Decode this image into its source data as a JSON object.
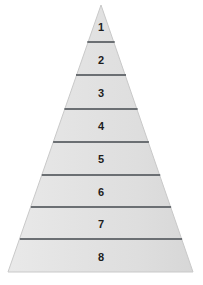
{
  "figure": {
    "name": "numbered-pyramid",
    "title": "",
    "shape": "triangle",
    "tier_count": 8,
    "background_color": "#ffffff",
    "fill_color": "#e3e3e3",
    "fill_color_light": "#ededed",
    "fill_color_dark": "#d8d8d8",
    "outline_color": "#c9c9c9",
    "divider_color": "#6b6f73",
    "label_color": "#1d1d1d",
    "apex": {
      "x": 101,
      "y": 5
    },
    "base_left": {
      "x": 8,
      "y": 272
    },
    "base_right": {
      "x": 193,
      "y": 272
    }
  },
  "chart_data": {
    "type": "pyramid",
    "title": "",
    "xlabel": "",
    "ylabel": "",
    "categories": [
      "1",
      "2",
      "3",
      "4",
      "5",
      "6",
      "7",
      "8"
    ],
    "values": [
      1,
      2,
      3,
      4,
      5,
      6,
      7,
      8
    ],
    "orientation": "apex-up",
    "legend": "none",
    "grid": false
  },
  "tiers": [
    {
      "label": "1",
      "index": 1,
      "top_y": 5,
      "bottom_y": 42,
      "center_x": 101,
      "center_y": 27,
      "font_size": 11
    },
    {
      "label": "2",
      "index": 2,
      "top_y": 42,
      "bottom_y": 75,
      "center_x": 101,
      "center_y": 60,
      "font_size": 11
    },
    {
      "label": "3",
      "index": 3,
      "top_y": 75,
      "bottom_y": 109,
      "center_x": 101,
      "center_y": 93,
      "font_size": 11
    },
    {
      "label": "4",
      "index": 4,
      "top_y": 109,
      "bottom_y": 142,
      "center_x": 101,
      "center_y": 126,
      "font_size": 11
    },
    {
      "label": "5",
      "index": 5,
      "top_y": 142,
      "bottom_y": 175,
      "center_x": 101,
      "center_y": 159,
      "font_size": 11
    },
    {
      "label": "6",
      "index": 6,
      "top_y": 175,
      "bottom_y": 207,
      "center_x": 101,
      "center_y": 192,
      "font_size": 11
    },
    {
      "label": "7",
      "index": 7,
      "top_y": 207,
      "bottom_y": 239,
      "center_x": 101,
      "center_y": 224,
      "font_size": 11
    },
    {
      "label": "8",
      "index": 8,
      "top_y": 239,
      "bottom_y": 272,
      "center_x": 101,
      "center_y": 257,
      "font_size": 11
    }
  ],
  "dividers": [
    {
      "y": 42,
      "x1": 87.3,
      "x2": 114.7,
      "thickness": 2
    },
    {
      "y": 75,
      "x1": 76.0,
      "x2": 126.0,
      "thickness": 2
    },
    {
      "y": 109,
      "x1": 64.4,
      "x2": 137.6,
      "thickness": 2
    },
    {
      "y": 142,
      "x1": 53.1,
      "x2": 148.9,
      "thickness": 2
    },
    {
      "y": 175,
      "x1": 41.8,
      "x2": 160.2,
      "thickness": 2
    },
    {
      "y": 207,
      "x1": 30.9,
      "x2": 171.1,
      "thickness": 2
    },
    {
      "y": 239,
      "x1": 19.9,
      "x2": 182.1,
      "thickness": 2
    }
  ]
}
